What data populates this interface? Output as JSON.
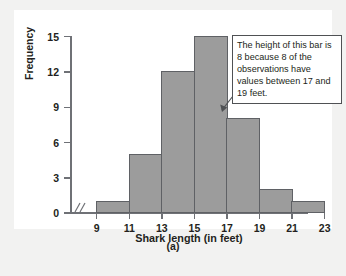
{
  "chart_data": {
    "type": "bar",
    "title": "",
    "xlabel": "Shark length (in feet)",
    "ylabel": "Frequency",
    "categories": [
      "9-11",
      "11-13",
      "13-15",
      "15-17",
      "17-19",
      "19-21",
      "21-23"
    ],
    "bin_edges": [
      9,
      11,
      13,
      15,
      17,
      19,
      21,
      23
    ],
    "values": [
      1,
      5,
      12,
      15,
      8,
      2,
      1
    ],
    "xlim": [
      9,
      23
    ],
    "ylim": [
      0,
      15
    ],
    "x_ticks": [
      "9",
      "11",
      "13",
      "15",
      "17",
      "19",
      "21",
      "23"
    ],
    "y_ticks": [
      "0",
      "3",
      "6",
      "9",
      "12",
      "15"
    ],
    "grid": false,
    "legend": false,
    "axis_break_x": true,
    "bar_color": "#9c9c9c",
    "bar_border_color": "#5f6165",
    "axis_color": "#6f7176",
    "annotations": [
      {
        "text": "The height of this bar is 8 because 8 of the observations have values between 17 and 19 feet.",
        "points_to_bin": "17-19",
        "points_to_value": 8
      }
    ]
  },
  "figure": {
    "caption": "(a)"
  },
  "axes": {
    "y_label": "Frequency",
    "x_label": "Shark length (in feet)",
    "break_symbol": "//"
  },
  "callout": {
    "text": "The height of this bar is 8 because 8 of the observations have values between 17 and 19 feet."
  }
}
